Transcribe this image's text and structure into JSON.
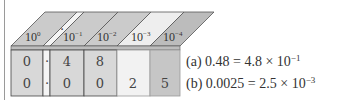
{
  "diagram": {
    "columns": [
      {
        "key": "c0",
        "base": "10",
        "exp": "0",
        "color_front": "#d6d6d6",
        "color_top": "#c9c9c9"
      },
      {
        "key": "c1",
        "base": "10",
        "exp": "−1",
        "color_front": "#d6d6d6",
        "color_top": "#c9c9c9"
      },
      {
        "key": "c2",
        "base": "10",
        "exp": "−2",
        "color_front": "#d6d6d6",
        "color_top": "#c9c9c9"
      },
      {
        "key": "c3",
        "base": "10",
        "exp": "−3",
        "color_front": "#f2f2f2",
        "color_top": "#ececec"
      },
      {
        "key": "c4",
        "base": "10",
        "exp": "−4",
        "color_front": "#c4c4c4",
        "color_top": "#bababa"
      }
    ],
    "decimal_point": "·",
    "rows": [
      {
        "cells": [
          "0",
          "4",
          "8",
          "",
          ""
        ]
      },
      {
        "cells": [
          "0",
          "0",
          "0",
          "2",
          "5"
        ]
      }
    ]
  },
  "equations": [
    {
      "label": "(a)",
      "lhs": "0.48",
      "eq": "=",
      "mantissa": "4.8",
      "times": "×",
      "base": "10",
      "exp": "−1"
    },
    {
      "label": "(b)",
      "lhs": "0.0025",
      "eq": "=",
      "mantissa": "2.5",
      "times": "×",
      "base": "10",
      "exp": "−3"
    }
  ]
}
